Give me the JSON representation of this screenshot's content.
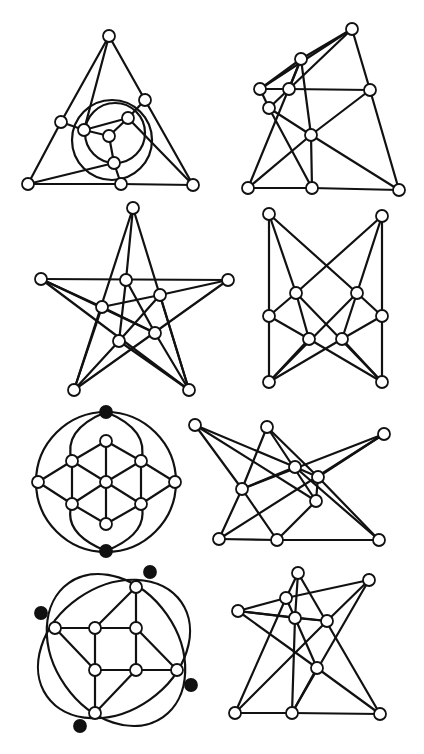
{
  "figure": {
    "caption_fragment": "",
    "stroke_color": "#111111",
    "node_fill": "#ffffff",
    "black_node_fill": "#111111",
    "node_radius": 6
  },
  "graphs": [
    {
      "id": "g1-triangle-circles",
      "nodes": [
        [
          109,
          36
        ],
        [
          145,
          100
        ],
        [
          128,
          118
        ],
        [
          61,
          122
        ],
        [
          84,
          130
        ],
        [
          109,
          136
        ],
        [
          114,
          163
        ],
        [
          28,
          184
        ],
        [
          121,
          184
        ],
        [
          193,
          185
        ]
      ],
      "black": [],
      "edges": [
        [
          0,
          3
        ],
        [
          0,
          4
        ],
        [
          0,
          1
        ],
        [
          1,
          9
        ],
        [
          1,
          2
        ],
        [
          2,
          9
        ],
        [
          2,
          5
        ],
        [
          3,
          4
        ],
        [
          3,
          7
        ],
        [
          4,
          5
        ],
        [
          5,
          6
        ],
        [
          6,
          7
        ],
        [
          6,
          8
        ],
        [
          7,
          8
        ],
        [
          8,
          9
        ],
        [
          4,
          2
        ]
      ],
      "circles": [
        [
          112,
          140,
          40
        ],
        [
          115,
          133,
          30
        ]
      ],
      "ellipses": []
    },
    {
      "id": "g2-quad",
      "nodes": [
        [
          352,
          29
        ],
        [
          301,
          59
        ],
        [
          260,
          89
        ],
        [
          289,
          89
        ],
        [
          370,
          90
        ],
        [
          269,
          108
        ],
        [
          311,
          135
        ],
        [
          248,
          188
        ],
        [
          312,
          188
        ],
        [
          399,
          190
        ]
      ],
      "black": [],
      "edges": [
        [
          0,
          1
        ],
        [
          0,
          2
        ],
        [
          0,
          3
        ],
        [
          0,
          4
        ],
        [
          1,
          2
        ],
        [
          1,
          3
        ],
        [
          1,
          6
        ],
        [
          1,
          7
        ],
        [
          2,
          3
        ],
        [
          2,
          5
        ],
        [
          3,
          4
        ],
        [
          3,
          5
        ],
        [
          4,
          6
        ],
        [
          4,
          9
        ],
        [
          5,
          6
        ],
        [
          5,
          8
        ],
        [
          6,
          7
        ],
        [
          6,
          8
        ],
        [
          6,
          9
        ],
        [
          7,
          8
        ],
        [
          8,
          9
        ]
      ],
      "circles": [],
      "ellipses": []
    },
    {
      "id": "g3-star",
      "nodes": [
        [
          133,
          208
        ],
        [
          41,
          279
        ],
        [
          228,
          280
        ],
        [
          126,
          280
        ],
        [
          160,
          295
        ],
        [
          102,
          307
        ],
        [
          155,
          333
        ],
        [
          119,
          341
        ],
        [
          74,
          390
        ],
        [
          189,
          390
        ]
      ],
      "black": [],
      "edges": [
        [
          0,
          3
        ],
        [
          0,
          8
        ],
        [
          0,
          9
        ],
        [
          1,
          2
        ],
        [
          1,
          6
        ],
        [
          1,
          9
        ],
        [
          2,
          4
        ],
        [
          2,
          8
        ],
        [
          3,
          7
        ],
        [
          3,
          6
        ],
        [
          4,
          5
        ],
        [
          4,
          7
        ],
        [
          5,
          6
        ],
        [
          5,
          8
        ],
        [
          6,
          9
        ],
        [
          7,
          8
        ],
        [
          7,
          9
        ],
        [
          4,
          9
        ],
        [
          5,
          1
        ]
      ],
      "circles": [],
      "ellipses": []
    },
    {
      "id": "g4-butterfly",
      "nodes": [
        [
          269,
          214
        ],
        [
          382,
          216
        ],
        [
          296,
          293
        ],
        [
          357,
          293
        ],
        [
          269,
          316
        ],
        [
          382,
          316
        ],
        [
          309,
          339
        ],
        [
          342,
          339
        ],
        [
          269,
          382
        ],
        [
          382,
          382
        ]
      ],
      "black": [],
      "edges": [
        [
          0,
          4
        ],
        [
          4,
          8
        ],
        [
          1,
          5
        ],
        [
          5,
          9
        ],
        [
          0,
          2
        ],
        [
          0,
          3
        ],
        [
          1,
          2
        ],
        [
          1,
          3
        ],
        [
          2,
          4
        ],
        [
          2,
          6
        ],
        [
          2,
          9
        ],
        [
          3,
          5
        ],
        [
          3,
          7
        ],
        [
          3,
          8
        ],
        [
          4,
          6
        ],
        [
          5,
          7
        ],
        [
          6,
          9
        ],
        [
          7,
          8
        ],
        [
          6,
          8
        ],
        [
          7,
          9
        ]
      ],
      "circles": [],
      "ellipses": []
    },
    {
      "id": "g5-circle-lattice",
      "nodes": [
        [
          106,
          412
        ],
        [
          106,
          551
        ],
        [
          106,
          441
        ],
        [
          106,
          482
        ],
        [
          106,
          524
        ],
        [
          72,
          461
        ],
        [
          141,
          461
        ],
        [
          72,
          504
        ],
        [
          141,
          504
        ],
        [
          38,
          482
        ],
        [
          175,
          482
        ]
      ],
      "black": [
        0,
        1
      ],
      "edges": [
        [
          2,
          3
        ],
        [
          3,
          4
        ],
        [
          2,
          5
        ],
        [
          2,
          6
        ],
        [
          4,
          7
        ],
        [
          4,
          8
        ],
        [
          5,
          3
        ],
        [
          6,
          3
        ],
        [
          7,
          3
        ],
        [
          8,
          3
        ],
        [
          5,
          7
        ],
        [
          6,
          8
        ],
        [
          5,
          9
        ],
        [
          7,
          9
        ],
        [
          6,
          10
        ],
        [
          8,
          10
        ]
      ],
      "circles": [
        [
          106,
          482,
          70
        ]
      ],
      "ellipses": [],
      "arcs": [
        "M106,412 Q62,430 72,461",
        "M106,412 Q150,430 141,461",
        "M106,551 Q62,533 72,504",
        "M106,551 Q150,533 141,504"
      ]
    },
    {
      "id": "g6-zigzag",
      "nodes": [
        [
          195,
          425
        ],
        [
          267,
          427
        ],
        [
          384,
          434
        ],
        [
          295,
          467
        ],
        [
          318,
          477
        ],
        [
          242,
          489
        ],
        [
          316,
          501
        ],
        [
          219,
          539
        ],
        [
          277,
          540
        ],
        [
          379,
          540
        ]
      ],
      "black": [],
      "edges": [
        [
          0,
          5
        ],
        [
          0,
          3
        ],
        [
          0,
          6
        ],
        [
          1,
          5
        ],
        [
          1,
          4
        ],
        [
          1,
          6
        ],
        [
          2,
          5
        ],
        [
          2,
          4
        ],
        [
          2,
          7
        ],
        [
          3,
          4
        ],
        [
          3,
          9
        ],
        [
          4,
          6
        ],
        [
          5,
          7
        ],
        [
          5,
          8
        ],
        [
          6,
          8
        ],
        [
          7,
          8
        ],
        [
          8,
          9
        ],
        [
          4,
          9
        ],
        [
          3,
          5
        ]
      ],
      "circles": [],
      "ellipses": []
    },
    {
      "id": "g7-rotated-ellipses",
      "nodes": [
        [
          150,
          572
        ],
        [
          41,
          613
        ],
        [
          191,
          685
        ],
        [
          80,
          726
        ],
        [
          136,
          587
        ],
        [
          55,
          628
        ],
        [
          177,
          670
        ],
        [
          95,
          713
        ],
        [
          95,
          628
        ],
        [
          136,
          628
        ],
        [
          95,
          670
        ],
        [
          136,
          670
        ]
      ],
      "black": [
        0,
        1,
        2,
        3
      ],
      "edges": [
        [
          4,
          9
        ],
        [
          4,
          8
        ],
        [
          5,
          8
        ],
        [
          5,
          10
        ],
        [
          6,
          11
        ],
        [
          6,
          9
        ],
        [
          7,
          10
        ],
        [
          7,
          11
        ],
        [
          8,
          9
        ],
        [
          9,
          11
        ],
        [
          10,
          11
        ],
        [
          8,
          10
        ]
      ],
      "circles": [],
      "ellipses": [
        [
          114,
          649,
          82,
          62,
          -35
        ],
        [
          116,
          650,
          82,
          62,
          55
        ]
      ]
    },
    {
      "id": "g8-star-quad",
      "nodes": [
        [
          298,
          573
        ],
        [
          369,
          580
        ],
        [
          286,
          598
        ],
        [
          238,
          611
        ],
        [
          295,
          618
        ],
        [
          327,
          621
        ],
        [
          317,
          668
        ],
        [
          235,
          713
        ],
        [
          292,
          713
        ],
        [
          380,
          714
        ]
      ],
      "black": [],
      "edges": [
        [
          0,
          2
        ],
        [
          0,
          4
        ],
        [
          0,
          9
        ],
        [
          1,
          2
        ],
        [
          1,
          5
        ],
        [
          1,
          8
        ],
        [
          2,
          3
        ],
        [
          2,
          7
        ],
        [
          3,
          4
        ],
        [
          3,
          5
        ],
        [
          3,
          6
        ],
        [
          4,
          5
        ],
        [
          4,
          6
        ],
        [
          4,
          8
        ],
        [
          5,
          7
        ],
        [
          6,
          8
        ],
        [
          6,
          9
        ],
        [
          7,
          8
        ],
        [
          8,
          9
        ],
        [
          2,
          4
        ]
      ],
      "circles": [],
      "ellipses": []
    }
  ]
}
